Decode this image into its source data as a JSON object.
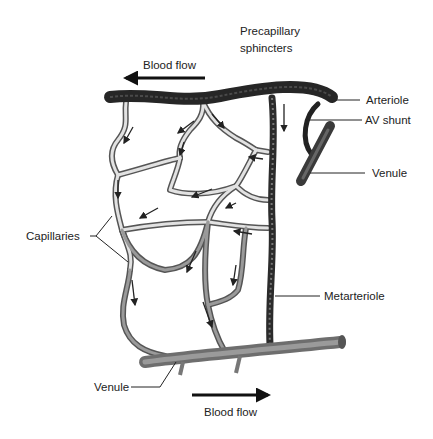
{
  "diagram": {
    "type": "microcirculation-capillary-bed",
    "labels": {
      "precapillary_line1": "Precapillary",
      "precapillary_line2": "sphincters",
      "blood_flow_top": "Blood flow",
      "arteriole": "Arteriole",
      "av_shunt": "AV shunt",
      "venule_right": "Venule",
      "capillaries": "Capillaries",
      "metarteriole": "Metarteriole",
      "venule_bottom": "Venule",
      "blood_flow_bottom": "Blood flow"
    },
    "flow_directions": {
      "top_arrow": "left",
      "bottom_arrow": "right"
    },
    "colors": {
      "arteriole": "#2a2a2a",
      "metarteriole": "#333333",
      "venule": "#7a7a7a",
      "capillary_fill": "#d8d8d8",
      "capillary_outline": "#555555",
      "text": "#222222"
    }
  }
}
